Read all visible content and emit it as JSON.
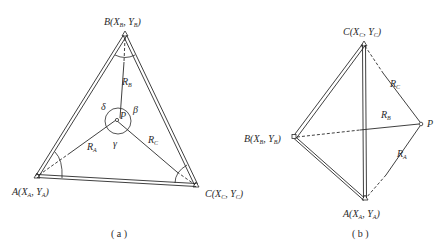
{
  "figure_a": {
    "caption": "( a )",
    "vertices": {
      "B": {
        "name": "B",
        "x_sym": "X",
        "x_sub": "B",
        "y_sym": "Y",
        "y_sub": "B"
      },
      "A": {
        "name": "A",
        "x_sym": "X",
        "x_sub": "A",
        "y_sym": "Y",
        "y_sub": "A"
      },
      "C": {
        "name": "C",
        "x_sym": "X",
        "x_sub": "C",
        "y_sym": "Y",
        "y_sub": "C"
      }
    },
    "point_label": "P",
    "distances": {
      "RA": {
        "sym": "R",
        "sub": "A"
      },
      "RB": {
        "sym": "R",
        "sub": "B"
      },
      "RC": {
        "sym": "R",
        "sub": "C"
      }
    },
    "angles": {
      "delta": "δ",
      "beta": "β",
      "gamma": "γ"
    }
  },
  "figure_b": {
    "caption": "( b )",
    "vertices": {
      "C": {
        "name": "C",
        "x_sym": "X",
        "x_sub": "C",
        "y_sym": "Y",
        "y_sub": "C"
      },
      "B": {
        "name": "B",
        "x_sym": "X",
        "x_sub": "B",
        "y_sym": "Y",
        "y_sub": "B"
      },
      "A": {
        "name": "A",
        "x_sym": "X",
        "x_sub": "A",
        "y_sym": "Y",
        "y_sub": "A"
      }
    },
    "point_label": "P",
    "distances": {
      "RA": {
        "sym": "R",
        "sub": "A"
      },
      "RB": {
        "sym": "R",
        "sub": "B"
      },
      "RC": {
        "sym": "R",
        "sub": "C"
      }
    }
  },
  "colors": {
    "ink": "#2a2a2a",
    "background": "#ffffff"
  }
}
